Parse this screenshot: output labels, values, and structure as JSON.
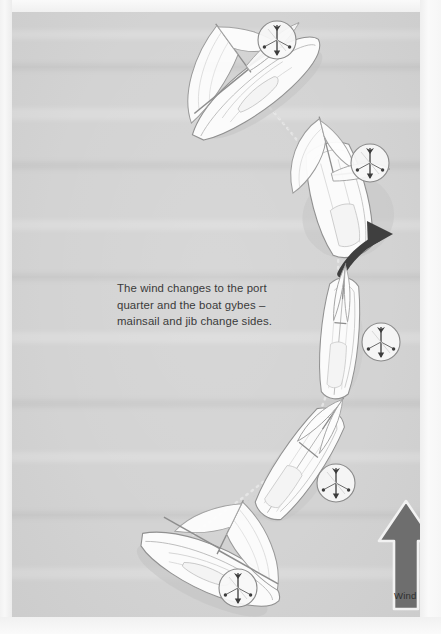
{
  "page": {
    "width": 441,
    "height": 634,
    "background_color": "#fdfdfd",
    "plate_color": "#d3d3d3"
  },
  "caption": {
    "text": "The wind changes to the port\nquarter and the boat gybes –\nmainsail and jib change sides.",
    "lines": [
      "The wind changes to the port",
      "quarter and the boat gybes –",
      "mainsail and jib change sides."
    ],
    "color": "#3a3a3a"
  },
  "wind_arrow": {
    "label": "Wind",
    "direction": "up",
    "color": "#6e6e6e",
    "outline_color": "#f0f0f0",
    "label_color": "#2e2e2e"
  },
  "gybe_arrow": {
    "name": "gybe-direction-arrow",
    "color": "#404040",
    "description": "curved arrow sweeping to starboard at boat 2"
  },
  "colors": {
    "hull_fill": "#fafafa",
    "hull_line": "#8d8d8d",
    "sail_fill": "#fcfcfc",
    "sail_line": "#9a9a9a",
    "shadow": "#bdbdbd",
    "wake": "#e6e6e6",
    "vane_circle_fill": "#f7f7f7",
    "vane_circle_line": "#8a8a8a",
    "vane_pin": "#3c3c3c"
  },
  "boats": [
    {
      "id": "boat-1",
      "order": 1,
      "label": "boat-broad-reach-starboard",
      "x": 205,
      "y": 35,
      "rotation": -38,
      "sail_side": "starboard",
      "state": "sailing on starboard gybe, sails out to port"
    },
    {
      "id": "boat-2",
      "order": 2,
      "label": "boat-gybing",
      "x": 295,
      "y": 145,
      "rotation": -16,
      "sail_side": "starboard",
      "state": "boom swinging across, gybe in progress"
    },
    {
      "id": "boat-3",
      "order": 3,
      "label": "boat-dead-downwind",
      "x": 318,
      "y": 288,
      "rotation": 4,
      "sail_side": "centred",
      "state": "sails centred, head-on view mid-gybe"
    },
    {
      "id": "boat-4",
      "order": 4,
      "label": "boat-turning-to-port",
      "x": 268,
      "y": 420,
      "rotation": 28,
      "sail_side": "centred",
      "state": "bearing away onto new gybe"
    },
    {
      "id": "boat-5",
      "order": 5,
      "label": "boat-new-gybe-port",
      "x": 158,
      "y": 513,
      "rotation": 44,
      "sail_side": "port",
      "state": "settled on port gybe, sails out to starboard"
    }
  ],
  "wind_vanes": [
    {
      "id": "vane-1",
      "for_boat": "boat-1",
      "cx": 277,
      "cy": 40,
      "r": 19,
      "arrow_angle_deg": 180
    },
    {
      "id": "vane-2",
      "for_boat": "boat-2",
      "cx": 370,
      "cy": 163,
      "r": 19,
      "arrow_angle_deg": 180
    },
    {
      "id": "vane-3",
      "for_boat": "boat-3",
      "cx": 381,
      "cy": 342,
      "r": 19,
      "arrow_angle_deg": 180
    },
    {
      "id": "vane-4",
      "for_boat": "boat-4",
      "cx": 336,
      "cy": 483,
      "r": 19,
      "arrow_angle_deg": 180
    },
    {
      "id": "vane-5",
      "for_boat": "boat-5",
      "cx": 238,
      "cy": 588,
      "r": 19,
      "arrow_angle_deg": 180
    }
  ],
  "track": {
    "name": "boat-track-wake",
    "style": "dotted",
    "color": "#e8e8e8",
    "description": "faint dotted wake curving from top-right boat down to bottom-left boat"
  }
}
